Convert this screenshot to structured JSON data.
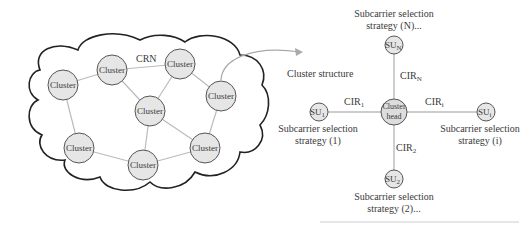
{
  "crn_network": {
    "label": "CRN",
    "clusters": [
      {
        "label": "Cluster",
        "cx": 63,
        "cy": 85
      },
      {
        "label": "Cluster",
        "cx": 112,
        "cy": 70
      },
      {
        "label": "Cluster",
        "cx": 180,
        "cy": 64
      },
      {
        "label": "Cluster",
        "cx": 150,
        "cy": 111
      },
      {
        "label": "Cluster",
        "cx": 221,
        "cy": 96
      },
      {
        "label": "Cluster",
        "cx": 79,
        "cy": 148
      },
      {
        "label": "Cluster",
        "cx": 143,
        "cy": 165
      },
      {
        "label": "Cluster",
        "cx": 205,
        "cy": 148
      }
    ]
  },
  "cluster_structure": {
    "title": "Cluster structure",
    "head": {
      "line1": "Cluster",
      "line2": "head"
    },
    "links": {
      "top": {
        "label": "CIR",
        "sub": "N"
      },
      "left": {
        "label": "CIR",
        "sub": "1"
      },
      "right": {
        "label": "CIR",
        "sub": "i"
      },
      "bottom": {
        "label": "CIR",
        "sub": "2"
      }
    },
    "nodes": {
      "top": {
        "label": "SU",
        "sub": "N",
        "caption1": "Subcarrier selection",
        "caption2": "strategy (N)..."
      },
      "left": {
        "label": "SU",
        "sub": "1",
        "caption1": "Subcarrier selection",
        "caption2": "strategy (1)"
      },
      "right": {
        "label": "SU",
        "sub": "i",
        "caption1": "Subcarrier selection",
        "caption2": "strategy (i)"
      },
      "bottom": {
        "label": "SU",
        "sub": "2",
        "caption1": "Subcarrier selection",
        "caption2": "strategy (2)..."
      }
    }
  },
  "colors": {
    "node_fill": "#e6e6e6",
    "node_stroke": "#555555",
    "link": "#bbbbbb",
    "cloud_stroke": "#222222"
  }
}
